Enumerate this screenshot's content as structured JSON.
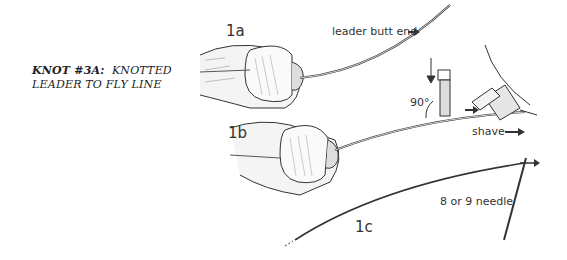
{
  "title": {
    "line1_bold": "KNOT #3A:",
    "line1_rest": "KNOTTED",
    "line2": "LEADER TO FLY LINE"
  },
  "steps": [
    {
      "id": "1a",
      "label": "1a"
    },
    {
      "id": "1b",
      "label": "1b"
    },
    {
      "id": "1c",
      "label": "1c"
    }
  ],
  "annotations": {
    "leader_butt_end": "leader butt end",
    "angle": "90°",
    "shave": "shave",
    "needle": "8 or 9 needle"
  },
  "colors": {
    "ink": "#333333",
    "background": "#ffffff"
  }
}
